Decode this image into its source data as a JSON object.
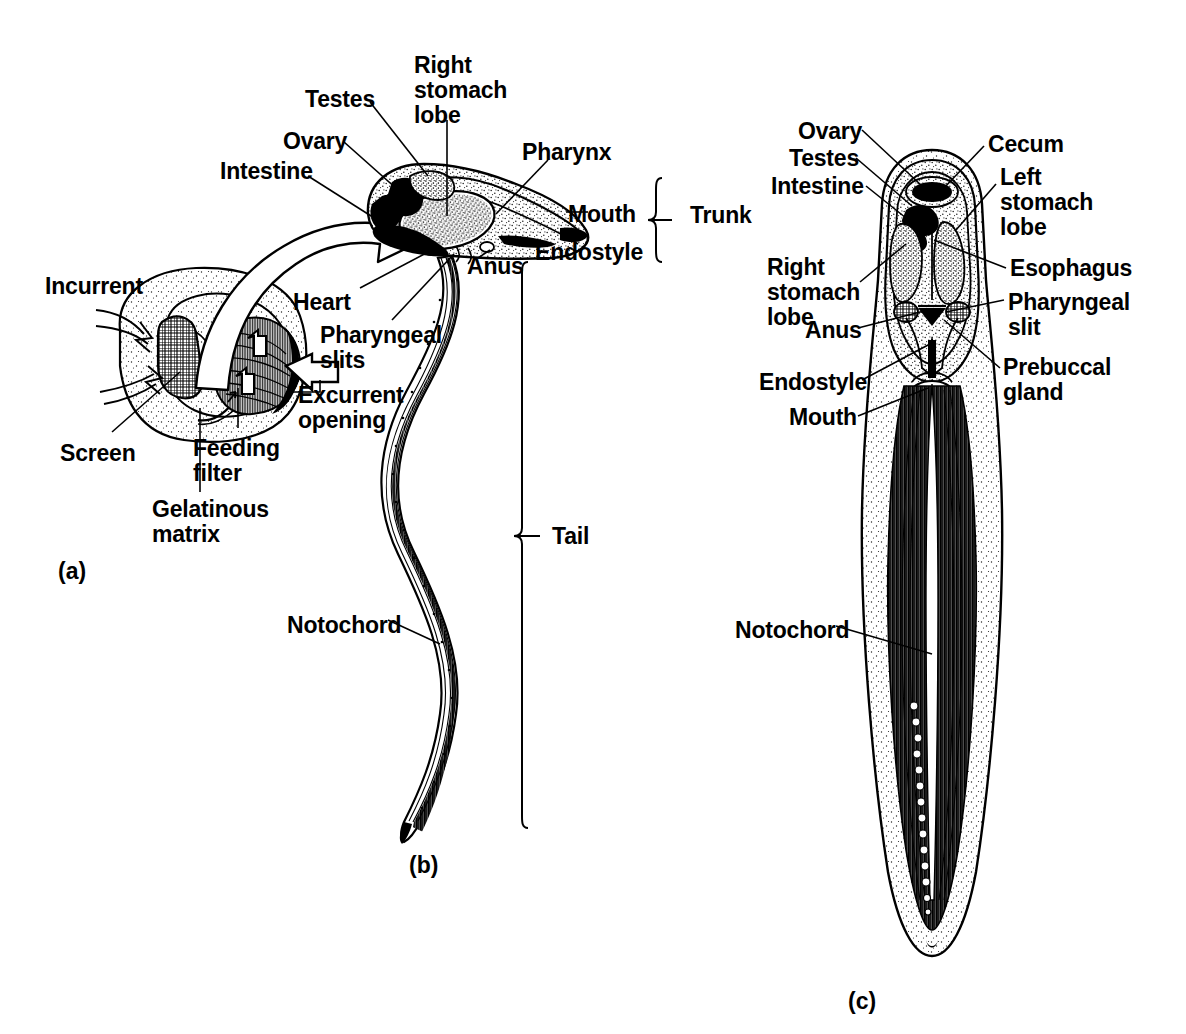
{
  "figure": {
    "background_color": "#ffffff",
    "ink_color": "#000000",
    "panel_ids": {
      "a": "(a)",
      "b": "(b)",
      "c": "(c)"
    }
  },
  "panel_a": {
    "caption": "(a)",
    "description": "Larvacean inside its gelatinous house with feeding filter and screen",
    "labels": [
      {
        "key": "incurrent",
        "text": "Incurrent",
        "x": 45,
        "y": 274,
        "align": "left"
      },
      {
        "key": "screen",
        "text": "Screen",
        "x": 60,
        "y": 441,
        "align": "left"
      },
      {
        "key": "feeding_filter",
        "text": "Feeding\nfilter",
        "x": 193,
        "y": 436,
        "align": "left"
      },
      {
        "key": "gelatinous_matrix",
        "text": "Gelatinous\nmatrix",
        "x": 152,
        "y": 497,
        "align": "left"
      },
      {
        "key": "excurrent_opening",
        "text": "Excurrent\nopening",
        "x": 298,
        "y": 383,
        "align": "left"
      }
    ]
  },
  "panel_b": {
    "caption": "(b)",
    "description": "Lateral view of larvacean showing trunk and tail",
    "labels": [
      {
        "key": "testes",
        "text": "Testes",
        "x": 305,
        "y": 87,
        "align": "left"
      },
      {
        "key": "ovary",
        "text": "Ovary",
        "x": 283,
        "y": 129,
        "align": "left"
      },
      {
        "key": "intestine",
        "text": "Intestine",
        "x": 220,
        "y": 159,
        "align": "left"
      },
      {
        "key": "right_stomach_lobe",
        "text": "Right\nstomach\nlobe",
        "x": 414,
        "y": 53,
        "align": "left"
      },
      {
        "key": "pharynx",
        "text": "Pharynx",
        "x": 522,
        "y": 140,
        "align": "left"
      },
      {
        "key": "mouth",
        "text": "Mouth",
        "x": 568,
        "y": 202,
        "align": "left"
      },
      {
        "key": "endostyle",
        "text": "Endostyle",
        "x": 535,
        "y": 240,
        "align": "left"
      },
      {
        "key": "anus",
        "text": "Anus",
        "x": 467,
        "y": 254,
        "align": "left"
      },
      {
        "key": "heart",
        "text": "Heart",
        "x": 293,
        "y": 290,
        "align": "left"
      },
      {
        "key": "pharyngeal_slits",
        "text": "Pharyngeal\nslits",
        "x": 320,
        "y": 323,
        "align": "left"
      },
      {
        "key": "notochord",
        "text": "Notochord",
        "x": 287,
        "y": 613,
        "align": "left"
      }
    ],
    "brackets": [
      {
        "key": "trunk",
        "text": "Trunk",
        "label_x": 690,
        "label_y": 213,
        "top": 178,
        "bottom": 262,
        "x": 656
      },
      {
        "key": "tail",
        "text": "Tail",
        "label_x": 552,
        "label_y": 534,
        "top": 262,
        "bottom": 828,
        "x": 522
      }
    ]
  },
  "panel_c": {
    "caption": "(c)",
    "description": "Dorsal view of larvacean trunk and tail",
    "labels": [
      {
        "key": "ovary",
        "text": "Ovary",
        "x": 798,
        "y": 119,
        "align": "left"
      },
      {
        "key": "testes",
        "text": "Testes",
        "x": 789,
        "y": 146,
        "align": "left"
      },
      {
        "key": "intestine",
        "text": "Intestine",
        "x": 771,
        "y": 174,
        "align": "left"
      },
      {
        "key": "cecum",
        "text": "Cecum",
        "x": 988,
        "y": 132,
        "align": "left"
      },
      {
        "key": "left_stomach_lobe",
        "text": "Left\nstomach\nlobe",
        "x": 1000,
        "y": 165,
        "align": "left"
      },
      {
        "key": "right_stomach_lobe",
        "text": "Right\nstomach\nlobe",
        "x": 767,
        "y": 255,
        "align": "left"
      },
      {
        "key": "esophagus",
        "text": "Esophagus",
        "x": 1010,
        "y": 256,
        "align": "left"
      },
      {
        "key": "pharyngeal_slit",
        "text": "Pharyngeal\nslit",
        "x": 1008,
        "y": 290,
        "align": "left"
      },
      {
        "key": "anus",
        "text": "Anus",
        "x": 805,
        "y": 318,
        "align": "left"
      },
      {
        "key": "endostyle",
        "text": "Endostyle",
        "x": 759,
        "y": 370,
        "align": "left"
      },
      {
        "key": "prebuccal_gland",
        "text": "Prebuccal\ngland",
        "x": 1003,
        "y": 355,
        "align": "left"
      },
      {
        "key": "mouth",
        "text": "Mouth",
        "x": 789,
        "y": 405,
        "align": "left"
      },
      {
        "key": "notochord",
        "text": "Notochord",
        "x": 735,
        "y": 618,
        "align": "left"
      }
    ]
  }
}
